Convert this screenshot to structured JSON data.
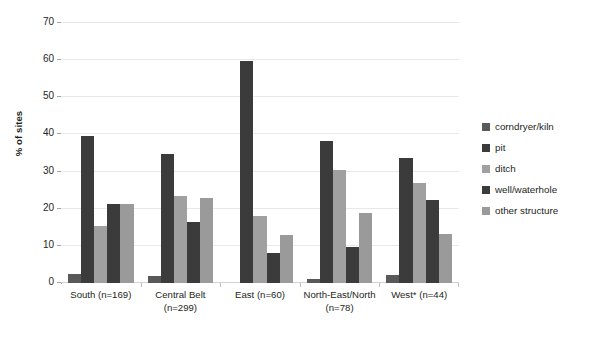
{
  "chart_data": {
    "type": "bar",
    "title": "",
    "xlabel": "",
    "ylabel": "% of sites",
    "ylim": [
      0,
      70
    ],
    "ytick_step": 10,
    "yticks": [
      70,
      60,
      50,
      40,
      30,
      20,
      10,
      0
    ],
    "grid": true,
    "legend_position": "right",
    "categories": [
      "South (n=169)",
      "Central Belt (n=299)",
      "East (n=60)",
      "North-East/North (n=78)",
      "West* (n=44)"
    ],
    "category_lines": [
      [
        "South (n=169)"
      ],
      [
        "Central Belt",
        "(n=299)"
      ],
      [
        "East (n=60)"
      ],
      [
        "North-East/North",
        "(n=78)"
      ],
      [
        "West* (n=44)"
      ]
    ],
    "series": [
      {
        "name": "corndryer/kiln",
        "color": "#595959",
        "values": [
          2.5,
          2.0,
          0.0,
          1.1,
          2.1
        ]
      },
      {
        "name": "pit",
        "color": "#3b3b3b",
        "values": [
          39.6,
          34.7,
          59.8,
          38.3,
          33.7
        ]
      },
      {
        "name": "ditch",
        "color": "#a0a0a0",
        "values": [
          15.3,
          23.3,
          18.0,
          30.3,
          27.0
        ]
      },
      {
        "name": "well/waterhole",
        "color": "#3b3b3b",
        "values": [
          21.2,
          16.4,
          8.0,
          9.8,
          22.4
        ]
      },
      {
        "name": "other structure",
        "color": "#9a9a9a",
        "values": [
          21.2,
          22.8,
          13.0,
          18.9,
          13.1
        ]
      }
    ]
  }
}
